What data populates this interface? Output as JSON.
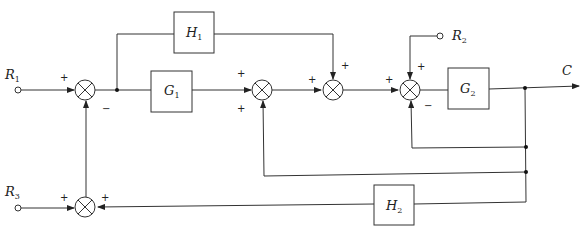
{
  "diagram": {
    "type": "block-diagram",
    "inputs": [
      {
        "id": "R1",
        "label": "R",
        "sub": "1"
      },
      {
        "id": "R2",
        "label": "R",
        "sub": "2"
      },
      {
        "id": "R3",
        "label": "R",
        "sub": "3"
      }
    ],
    "output": {
      "id": "C",
      "label": "C"
    },
    "blocks": [
      {
        "id": "G1",
        "label": "G",
        "sub": "1"
      },
      {
        "id": "G2",
        "label": "G",
        "sub": "2"
      },
      {
        "id": "H1",
        "label": "H",
        "sub": "1"
      },
      {
        "id": "H2",
        "label": "H",
        "sub": "2"
      }
    ],
    "summing_junctions": [
      {
        "id": "S1",
        "signs": {
          "left": "+",
          "bottom": "−"
        }
      },
      {
        "id": "S2",
        "signs": {
          "left": "+",
          "bottom": "+"
        }
      },
      {
        "id": "S3",
        "signs": {
          "left": "+",
          "top": "+"
        }
      },
      {
        "id": "S4",
        "signs": {
          "left": "+",
          "top": "+",
          "bottom": "−"
        }
      },
      {
        "id": "S5",
        "signs": {
          "left": "+",
          "right": "+"
        }
      }
    ],
    "connections": [
      "R1 -> S1(+)",
      "S5 -> S1(−)",
      "S1 -> G1",
      "S1 -> H1",
      "G1 -> S2(+)",
      "S2 -> S3(+)",
      "H1 -> S3(+)",
      "S3 -> S4(+)",
      "R2 -> S4(+)",
      "S4 -> G2",
      "G2 -> C",
      "C -> S4(−)",
      "C -> S2(+)",
      "C -> H2",
      "H2 -> S5(+)",
      "R3 -> S5(+)"
    ],
    "sign_labels": {
      "plus": "+",
      "minus": "−"
    }
  }
}
